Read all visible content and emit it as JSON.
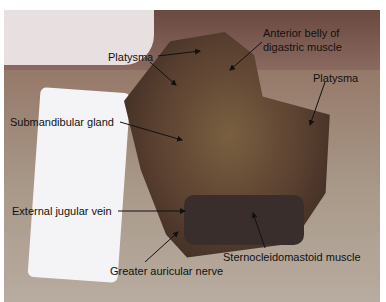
{
  "figure": {
    "type": "surgical photograph",
    "labels": [
      {
        "text": "Anterior belly of",
        "x": 263,
        "y": 33
      },
      {
        "text": "digastric muscle",
        "x": 263,
        "y": 47
      },
      {
        "text": "Platysma",
        "x": 108,
        "y": 52
      },
      {
        "text": "Platysma",
        "x": 313,
        "y": 73
      },
      {
        "text": "Submandibular gland",
        "x": 10,
        "y": 116
      },
      {
        "text": "External jugular vein",
        "x": 12,
        "y": 205
      },
      {
        "text": "Sternocleidomastoid muscle",
        "x": 223,
        "y": 253
      },
      {
        "text": "Greater auricular nerve",
        "x": 110,
        "y": 266
      }
    ]
  }
}
